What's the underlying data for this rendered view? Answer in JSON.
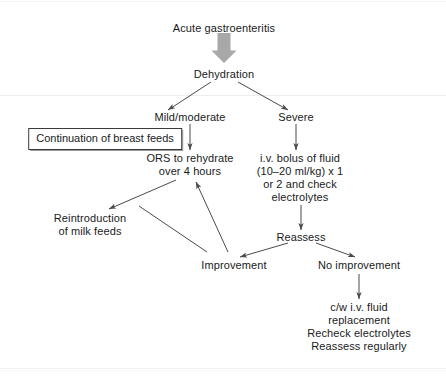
{
  "diagram": {
    "type": "flowchart",
    "colors": {
      "text": "#1a1a1a",
      "edge": "#4a4a4a",
      "block_arrow": "#a8a8a8",
      "box_border": "#3a3a3a",
      "background": "#ffffff"
    },
    "nodes": {
      "acute_gastroenteritis": {
        "label": "Acute gastroenteritis"
      },
      "dehydration": {
        "label": "Dehydration"
      },
      "mild_moderate": {
        "label": "Mild/moderate"
      },
      "severe": {
        "label": "Severe"
      },
      "breast_feeds": {
        "label": "Continuation of breast feeds"
      },
      "ors": {
        "line1": "ORS to rehydrate",
        "line2": "over 4 hours"
      },
      "iv_bolus": {
        "line1": "i.v. bolus of fluid",
        "line2": "(10–20 ml/kg) x 1",
        "line3": "or 2 and check",
        "line4": "electrolytes"
      },
      "reintroduction": {
        "line1": "Reintroduction",
        "line2": "of milk feeds"
      },
      "reassess": {
        "label": "Reassess"
      },
      "improvement": {
        "label": "Improvement"
      },
      "no_improvement": {
        "label": "No improvement"
      },
      "continue_iv": {
        "line1": "c/w i.v. fluid",
        "line2": "replacement",
        "line3": "Recheck electrolytes",
        "line4": "Reassess regularly"
      }
    }
  }
}
